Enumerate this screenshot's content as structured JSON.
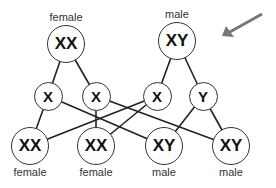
{
  "parents": [
    {
      "id": "mother",
      "genotype": "XX",
      "label": "female",
      "x": 66,
      "y": 44
    },
    {
      "id": "father",
      "genotype": "XY",
      "label": "male",
      "x": 177,
      "y": 41
    }
  ],
  "gametes": [
    {
      "id": "g1",
      "allele": "X",
      "x": 48,
      "y": 96
    },
    {
      "id": "g2",
      "allele": "X",
      "x": 96,
      "y": 96
    },
    {
      "id": "g3",
      "allele": "X",
      "x": 157,
      "y": 96
    },
    {
      "id": "g4",
      "allele": "Y",
      "x": 203,
      "y": 96
    }
  ],
  "offspring": [
    {
      "id": "o1",
      "genotype": "XX",
      "label": "female",
      "x": 30,
      "y": 146
    },
    {
      "id": "o2",
      "genotype": "XX",
      "label": "female",
      "x": 96,
      "y": 146
    },
    {
      "id": "o3",
      "genotype": "XY",
      "label": "male",
      "x": 164,
      "y": 146
    },
    {
      "id": "o4",
      "genotype": "XY",
      "label": "male",
      "x": 231,
      "y": 146
    }
  ],
  "edges": [
    [
      "mother",
      "g1"
    ],
    [
      "mother",
      "g2"
    ],
    [
      "father",
      "g3"
    ],
    [
      "father",
      "g4"
    ],
    [
      "g1",
      "o1"
    ],
    [
      "g1",
      "o3"
    ],
    [
      "g2",
      "o2"
    ],
    [
      "g2",
      "o4"
    ],
    [
      "g3",
      "o1"
    ],
    [
      "g3",
      "o2"
    ],
    [
      "g4",
      "o3"
    ],
    [
      "g4",
      "o4"
    ]
  ],
  "arrow": {
    "from": [
      262,
      14
    ],
    "to": [
      222,
      36
    ],
    "color": "#777777"
  }
}
